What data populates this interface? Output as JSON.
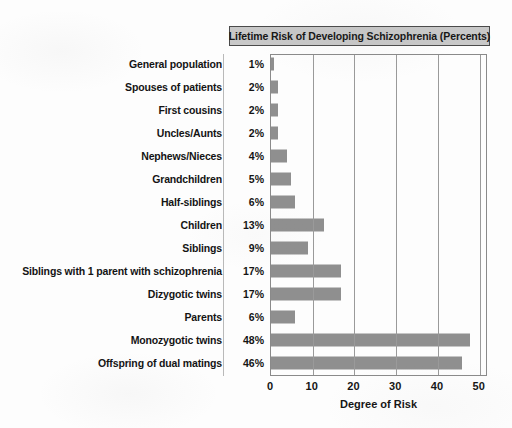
{
  "chart_data": {
    "type": "bar",
    "orientation": "horizontal",
    "title": "Lifetime Risk of Developing Schizophrenia (Percents)",
    "xlabel": "Degree of Risk",
    "ylabel": "",
    "xlim": [
      0,
      52
    ],
    "xticks": [
      0,
      10,
      20,
      30,
      40,
      50
    ],
    "grid": true,
    "legend": null,
    "bar_color": "#8f8f8f",
    "categories": [
      "General population",
      "Spouses of patients",
      "First cousins",
      "Uncles/Aunts",
      "Nephews/Nieces",
      "Grandchildren",
      "Half-siblings",
      "Children",
      "Siblings",
      "Siblings with 1 parent with schizophrenia",
      "Dizygotic twins",
      "Parents",
      "Monozygotic twins",
      "Offspring of dual matings"
    ],
    "values": [
      1,
      2,
      2,
      2,
      4,
      5,
      6,
      13,
      9,
      17,
      17,
      6,
      48,
      46
    ],
    "value_labels": [
      "1%",
      "2%",
      "2%",
      "2%",
      "4%",
      "5%",
      "6%",
      "13%",
      "9%",
      "17%",
      "17%",
      "6%",
      "48%",
      "46%"
    ]
  }
}
